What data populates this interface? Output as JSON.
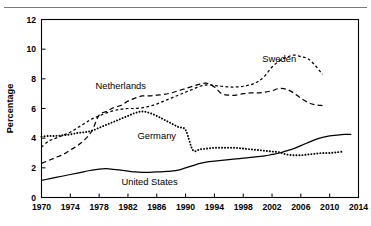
{
  "figure": {
    "top_rule": "horizontal-rule"
  },
  "chart_data": {
    "type": "line",
    "title": "",
    "xlabel": "",
    "ylabel": "Percentage",
    "xlim": [
      1970,
      2014
    ],
    "ylim": [
      0,
      12
    ],
    "grid": false,
    "legend_position": "inline-annotations",
    "xticks": [
      1970,
      1974,
      1978,
      1982,
      1986,
      1990,
      1994,
      1998,
      2002,
      2006,
      2010,
      2014
    ],
    "yticks": [
      0,
      2,
      4,
      6,
      8,
      10,
      12
    ],
    "series": [
      {
        "name": "Sweden",
        "style": "short-dash",
        "color": "#000000",
        "label_x": 2003,
        "label_y": 9.35,
        "x": [
          1970,
          1971,
          1972,
          1973,
          1974,
          1975,
          1976,
          1977,
          1978,
          1979,
          1980,
          1981,
          1982,
          1983,
          1984,
          1985,
          1986,
          1987,
          1988,
          1989,
          1990,
          1991,
          1992,
          1993,
          1994,
          1995,
          1996,
          1997,
          1998,
          1999,
          2000,
          2001,
          2002,
          2003,
          2004,
          2005,
          2006,
          2007,
          2008,
          2009
        ],
        "y": [
          3.4,
          3.8,
          4.0,
          4.2,
          4.4,
          4.7,
          5.0,
          5.3,
          5.5,
          5.7,
          5.85,
          5.95,
          6.0,
          6.0,
          6.05,
          6.15,
          6.3,
          6.5,
          6.7,
          6.9,
          7.1,
          7.3,
          7.5,
          7.6,
          7.55,
          7.5,
          7.45,
          7.45,
          7.5,
          7.6,
          7.8,
          8.2,
          8.8,
          9.2,
          9.45,
          9.6,
          9.5,
          9.35,
          8.9,
          8.3
        ]
      },
      {
        "name": "Netherlands",
        "style": "long-dash",
        "color": "#000000",
        "label_x": 1981,
        "label_y": 7.55,
        "x": [
          1970,
          1971,
          1972,
          1973,
          1974,
          1975,
          1976,
          1977,
          1978,
          1979,
          1980,
          1981,
          1982,
          1983,
          1984,
          1985,
          1986,
          1987,
          1988,
          1989,
          1990,
          1991,
          1992,
          1993,
          1994,
          1995,
          1996,
          1997,
          1998,
          1999,
          2000,
          2001,
          2002,
          2003,
          2004,
          2005,
          2006,
          2007,
          2008,
          2009
        ],
        "y": [
          2.3,
          2.5,
          2.7,
          2.9,
          3.2,
          3.5,
          3.9,
          4.5,
          5.55,
          5.8,
          6.05,
          6.2,
          6.5,
          6.7,
          6.85,
          6.85,
          6.9,
          6.95,
          7.05,
          7.2,
          7.35,
          7.5,
          7.65,
          7.7,
          7.45,
          7.0,
          6.9,
          6.9,
          7.0,
          7.05,
          7.05,
          7.1,
          7.2,
          7.35,
          7.3,
          7.05,
          6.7,
          6.4,
          6.25,
          6.2
        ]
      },
      {
        "name": "Germany",
        "style": "dotted",
        "color": "#000000",
        "label_x": 1986,
        "label_y": 4.15,
        "x": [
          1970,
          1971,
          1972,
          1973,
          1974,
          1975,
          1976,
          1977,
          1978,
          1979,
          1980,
          1981,
          1982,
          1983,
          1984,
          1985,
          1986,
          1987,
          1988,
          1989,
          1990,
          1991,
          1992,
          1993,
          1994,
          1995,
          1996,
          1997,
          1998,
          1999,
          2000,
          2001,
          2002,
          2003,
          2004,
          2005,
          2006,
          2007,
          2008,
          2009,
          2010,
          2011,
          2012
        ],
        "y": [
          4.1,
          4.15,
          4.15,
          4.2,
          4.25,
          4.35,
          4.4,
          4.5,
          4.7,
          4.9,
          5.1,
          5.3,
          5.5,
          5.7,
          5.8,
          5.7,
          5.5,
          5.25,
          5.0,
          4.75,
          4.55,
          3.2,
          3.25,
          3.3,
          3.35,
          3.35,
          3.35,
          3.35,
          3.3,
          3.25,
          3.2,
          3.15,
          3.1,
          3.05,
          2.9,
          2.85,
          2.85,
          2.9,
          2.95,
          3.0,
          3.0,
          3.05,
          3.1
        ]
      },
      {
        "name": "United States",
        "style": "solid",
        "color": "#000000",
        "label_x": 1985,
        "label_y": 1.05,
        "x": [
          1970,
          1971,
          1972,
          1973,
          1974,
          1975,
          1976,
          1977,
          1978,
          1979,
          1980,
          1981,
          1982,
          1983,
          1984,
          1985,
          1986,
          1987,
          1988,
          1989,
          1990,
          1991,
          1992,
          1993,
          1994,
          1995,
          1996,
          1997,
          1998,
          1999,
          2000,
          2001,
          2002,
          2003,
          2004,
          2005,
          2006,
          2007,
          2008,
          2009,
          2010,
          2011,
          2012,
          2013
        ],
        "y": [
          1.15,
          1.25,
          1.35,
          1.45,
          1.55,
          1.65,
          1.75,
          1.85,
          1.92,
          1.95,
          1.9,
          1.85,
          1.78,
          1.72,
          1.7,
          1.7,
          1.72,
          1.75,
          1.78,
          1.85,
          2.0,
          2.15,
          2.3,
          2.4,
          2.45,
          2.5,
          2.55,
          2.6,
          2.65,
          2.7,
          2.75,
          2.8,
          2.9,
          3.0,
          3.15,
          3.3,
          3.5,
          3.7,
          3.9,
          4.05,
          4.15,
          4.2,
          4.25,
          4.25
        ]
      }
    ]
  }
}
